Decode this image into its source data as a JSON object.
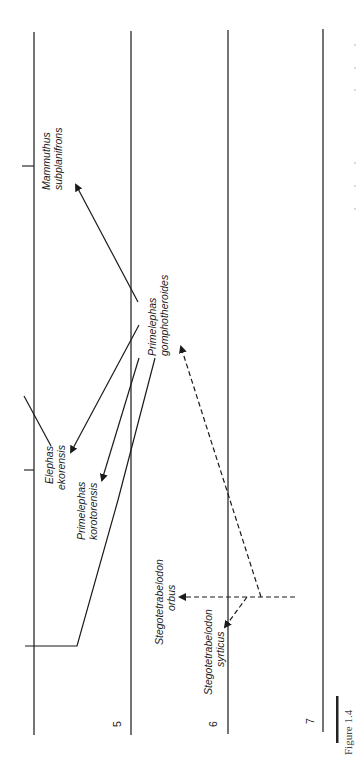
{
  "figure": {
    "label": "Figure 1.4",
    "orientation": "rotated 90° counter-clockwise",
    "ink_color": "#1a1a1a",
    "background": "#ffffff"
  },
  "time_axis": {
    "ticks": [
      {
        "label": "5"
      },
      {
        "label": "6"
      },
      {
        "label": "7"
      }
    ]
  },
  "taxa": [
    {
      "id": "mammuthus",
      "line1": "Mammuthus",
      "line2": "subplanifrons"
    },
    {
      "id": "elephas",
      "line1": "Elephas",
      "line2": "ekorensis"
    },
    {
      "id": "primelephas-koro",
      "line1": "Primelephas",
      "line2": "korotorensis"
    },
    {
      "id": "primelephas-gomph",
      "line1": "Primelephas",
      "line2": "gomphotheroides"
    },
    {
      "id": "stego-orbus",
      "line1": "Stegotetrabelodon",
      "line2": "orbus"
    },
    {
      "id": "stego-syrticus",
      "line1": "Stegotetrabelodon",
      "line2": "syrticus"
    }
  ],
  "links": [
    {
      "from": "primelephas-gomph",
      "to": "mammuthus",
      "style": "solid"
    },
    {
      "from": "primelephas-gomph",
      "to": "elephas",
      "style": "solid"
    },
    {
      "from": "primelephas-gomph",
      "to": "primelephas-koro",
      "style": "solid"
    },
    {
      "from": "stego-root",
      "to": "primelephas-gomph",
      "style": "dashed"
    },
    {
      "from": "stego-root",
      "to": "stego-orbus",
      "style": "dashed"
    },
    {
      "from": "stego-root",
      "to": "stego-syrticus",
      "style": "dashed"
    }
  ]
}
